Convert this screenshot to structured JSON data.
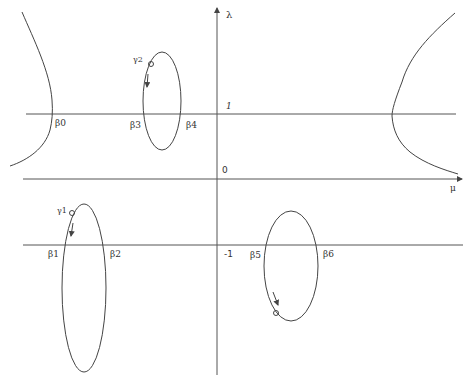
{
  "diagram": {
    "axes": {
      "vertical_label": "λ",
      "horizontal_label": "μ",
      "origin_label": "0",
      "upper_level_label": "1",
      "lower_level_label": "-1"
    },
    "points": {
      "beta0": "β0",
      "beta1": "β1",
      "beta2": "β2",
      "beta3": "β3",
      "beta4": "β4",
      "beta5": "β5",
      "beta6": "β6"
    },
    "paths": {
      "gamma1": "γ1",
      "gamma2": "γ2"
    },
    "colors": {
      "stroke": "#444444",
      "background": "#ffffff"
    }
  }
}
